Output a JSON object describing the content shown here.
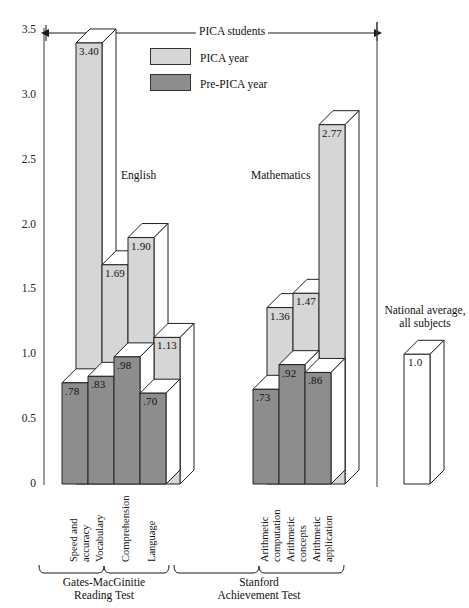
{
  "chart_data": {
    "type": "bar",
    "title": "",
    "xlabel": "",
    "ylabel": "",
    "ylim": [
      0,
      3.5
    ],
    "grid": false,
    "legend_position": "top-center",
    "annotations": {
      "span_bracket": "PICA students",
      "group_english": "English",
      "group_mathematics": "Mathematics",
      "national_line1": "National average,",
      "national_line2": "all subjects",
      "test_gates_line1": "Gates-MacGinitie",
      "test_gates_line2": "Reading Test",
      "test_stanford_line1": "Stanford",
      "test_stanford_line2": "Achievement Test"
    },
    "ytick_labels": [
      "0",
      "0.5",
      "1.0",
      "1.5",
      "2.0",
      "2.5",
      "3.0",
      "3.5"
    ],
    "ytick_values": [
      0,
      0.5,
      1.0,
      1.5,
      2.0,
      2.5,
      3.0,
      3.5
    ],
    "categories": [
      "Speed and accuracy",
      "Vocabulary",
      "Comprehension",
      "Language",
      "Arithmetic computation",
      "Arithmetic concepts",
      "Arithmetic application"
    ],
    "category_lines": [
      [
        "Speed and",
        "accuracy"
      ],
      [
        "Vocabulary"
      ],
      [
        "Comprehension"
      ],
      [
        "Language"
      ],
      [
        "Arithmetic",
        "computation"
      ],
      [
        "Arithmetic",
        "concepts"
      ],
      [
        "Arithmetic",
        "application"
      ]
    ],
    "series": [
      {
        "name": "PICA year",
        "color": "#d6d6d6",
        "values": [
          3.4,
          1.69,
          1.9,
          1.13,
          1.36,
          1.47,
          2.77
        ],
        "labels": [
          "3.40",
          "1.69",
          "1.90",
          "1.13",
          "1.36",
          "1.47",
          "2.77"
        ]
      },
      {
        "name": "Pre-PICA year",
        "color": "#8d8d8d",
        "values": [
          0.78,
          0.83,
          0.98,
          0.7,
          0.73,
          0.92,
          0.86
        ],
        "labels": [
          ".78",
          ".83",
          ".98",
          ".70",
          ".73",
          ".92",
          ".86"
        ]
      }
    ],
    "reference_bar": {
      "name": "National average, all subjects",
      "color": "#ffffff",
      "value": 1.0,
      "label": "1.0"
    }
  },
  "legend": {
    "items": [
      {
        "label": "PICA year",
        "color": "#d6d6d6"
      },
      {
        "label": "Pre-PICA year",
        "color": "#8d8d8d"
      }
    ]
  }
}
